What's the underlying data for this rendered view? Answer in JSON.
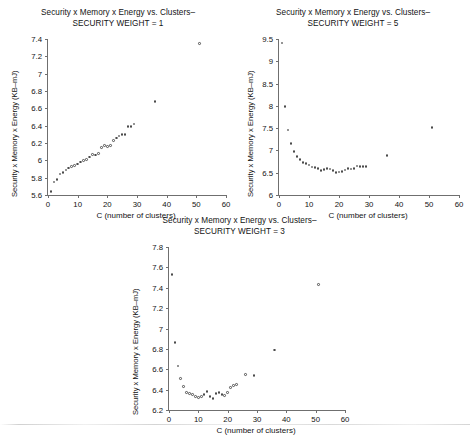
{
  "page": {
    "kind": "scatter-plot-figure-set",
    "panel_count": 3
  },
  "shared": {
    "title_line1": "Security x Memory x Energy vs. Clusters–",
    "xlabel": "C (number of clusters)",
    "ylabel": "Security x Memory x Energy (KB–mJ)",
    "xticks": [
      "0",
      "10",
      "20",
      "30",
      "40",
      "50",
      "60"
    ],
    "marker": "open-diamond",
    "marker_color": "#4a4a4a"
  },
  "chart_data": [
    {
      "id": "panel-weight-1",
      "type": "scatter",
      "title": "Security x Memory x Energy vs. Clusters– SECURITY WEIGHT = 1",
      "title_line1": "Security x Memory x Energy vs. Clusters–",
      "title_line2": "SECURITY WEIGHT = 1",
      "security_weight": 1,
      "xlabel": "C (number of clusters)",
      "ylabel": "Security x Memory x Energy (KB–mJ)",
      "xlim": [
        0,
        60
      ],
      "ylim": [
        5.6,
        7.4
      ],
      "xticks": [
        0,
        10,
        20,
        30,
        40,
        50,
        60
      ],
      "yticks": [
        5.6,
        5.8,
        6.0,
        6.2,
        6.4,
        6.6,
        6.8,
        7.0,
        7.2,
        7.4
      ],
      "ytick_labels": [
        "5.6",
        "5.8",
        "6",
        "6.2",
        "6.4",
        "6.6",
        "6.8",
        "7",
        "7.2",
        "7.4"
      ],
      "grid": false,
      "legend": null,
      "x": [
        1,
        2,
        3,
        4,
        5,
        6,
        7,
        8,
        9,
        10,
        11,
        12,
        13,
        14,
        15,
        16,
        17,
        18,
        19,
        20,
        21,
        22,
        23,
        24,
        25,
        26,
        27,
        28,
        29,
        36,
        51
      ],
      "y": [
        5.64,
        5.75,
        5.78,
        5.84,
        5.86,
        5.89,
        5.91,
        5.93,
        5.94,
        5.96,
        5.98,
        6.0,
        6.01,
        6.04,
        6.07,
        6.06,
        6.08,
        6.15,
        6.17,
        6.16,
        6.17,
        6.23,
        6.26,
        6.28,
        6.3,
        6.3,
        6.39,
        6.39,
        6.42,
        6.68,
        7.35
      ]
    },
    {
      "id": "panel-weight-5",
      "type": "scatter",
      "title": "Security x Memory x Energy vs. Clusters– SECURITY WEIGHT = 5",
      "title_line1": "Security x Memory x Energy vs. Clusters–",
      "title_line2": "SECURITY WEIGHT = 5",
      "security_weight": 5,
      "xlabel": "C (number of clusters)",
      "ylabel": "Security x Memory x Energy (KB–mJ)",
      "xlim": [
        0,
        60
      ],
      "ylim": [
        6.0,
        9.5
      ],
      "xticks": [
        0,
        10,
        20,
        30,
        40,
        50,
        60
      ],
      "yticks": [
        6.0,
        6.5,
        7.0,
        7.5,
        8.0,
        8.5,
        9.0,
        9.5
      ],
      "ytick_labels": [
        "6",
        "6.5",
        "7",
        "7.5",
        "8",
        "8.5",
        "9",
        "9.5"
      ],
      "grid": false,
      "legend": null,
      "x": [
        1,
        2,
        3,
        4,
        5,
        6,
        7,
        8,
        9,
        10,
        11,
        12,
        13,
        14,
        15,
        16,
        17,
        18,
        19,
        20,
        21,
        22,
        23,
        24,
        25,
        26,
        27,
        28,
        29,
        36,
        51
      ],
      "y": [
        9.41,
        7.99,
        7.46,
        7.16,
        6.97,
        6.87,
        6.79,
        6.73,
        6.71,
        6.67,
        6.63,
        6.62,
        6.59,
        6.55,
        6.57,
        6.6,
        6.58,
        6.55,
        6.51,
        6.52,
        6.53,
        6.56,
        6.59,
        6.58,
        6.59,
        6.65,
        6.64,
        6.64,
        6.64,
        6.88,
        7.52
      ]
    },
    {
      "id": "panel-weight-3",
      "type": "scatter",
      "title": "Security x Memory x Energy vs. Clusters– SECURITY WEIGHT = 3",
      "title_line1": "Security x Memory x Energy vs. Clusters–",
      "title_line2": "SECURITY WEIGHT = 3",
      "security_weight": 3,
      "xlabel": "C (number of clusters)",
      "ylabel": "Security x Memory x Energy (KB–mJ)",
      "xlim": [
        0,
        60
      ],
      "ylim": [
        6.2,
        7.8
      ],
      "xticks": [
        0,
        10,
        20,
        30,
        40,
        50,
        60
      ],
      "yticks": [
        6.2,
        6.4,
        6.6,
        6.8,
        7.0,
        7.2,
        7.4,
        7.6,
        7.8
      ],
      "ytick_labels": [
        "6.2",
        "6.4",
        "6.6",
        "6.8",
        "7",
        "7.2",
        "7.4",
        "7.6",
        "7.8"
      ],
      "grid": false,
      "legend": null,
      "x": [
        1,
        2,
        3,
        4,
        5,
        6,
        7,
        8,
        9,
        10,
        11,
        12,
        13,
        14,
        15,
        16,
        17,
        18,
        19,
        20,
        21,
        22,
        23,
        26,
        29,
        36,
        51
      ],
      "y": [
        7.53,
        6.86,
        6.63,
        6.51,
        6.43,
        6.37,
        6.36,
        6.35,
        6.33,
        6.32,
        6.33,
        6.35,
        6.38,
        6.33,
        6.31,
        6.36,
        6.37,
        6.35,
        6.34,
        6.37,
        6.42,
        6.44,
        6.45,
        6.55,
        6.54,
        6.79,
        7.43
      ]
    }
  ]
}
